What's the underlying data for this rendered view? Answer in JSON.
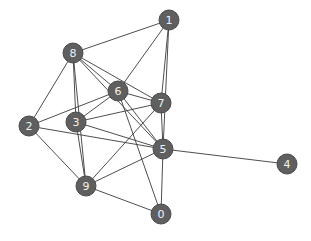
{
  "graph": {
    "node_color": "#5f5f5f",
    "label_color": "#f2f2f2",
    "edge_color": "#3a3a3a",
    "nodes": [
      {
        "id": "0",
        "label": "0",
        "x": 161,
        "y": 214
      },
      {
        "id": "1",
        "label": "1",
        "x": 169,
        "y": 20
      },
      {
        "id": "2",
        "label": "2",
        "x": 29,
        "y": 126
      },
      {
        "id": "3",
        "label": "3",
        "x": 76,
        "y": 122
      },
      {
        "id": "4",
        "label": "4",
        "x": 287,
        "y": 164
      },
      {
        "id": "5",
        "label": "5",
        "x": 163,
        "y": 149
      },
      {
        "id": "6",
        "label": "6",
        "x": 118,
        "y": 91
      },
      {
        "id": "7",
        "label": "7",
        "x": 161,
        "y": 103
      },
      {
        "id": "8",
        "label": "8",
        "x": 73,
        "y": 53
      },
      {
        "id": "9",
        "label": "9",
        "x": 86,
        "y": 186
      }
    ],
    "edges": [
      [
        "8",
        "1"
      ],
      [
        "8",
        "2"
      ],
      [
        "8",
        "3"
      ],
      [
        "8",
        "9"
      ],
      [
        "8",
        "6"
      ],
      [
        "8",
        "7"
      ],
      [
        "8",
        "5"
      ],
      [
        "1",
        "6"
      ],
      [
        "1",
        "7"
      ],
      [
        "1",
        "5"
      ],
      [
        "2",
        "6"
      ],
      [
        "2",
        "5"
      ],
      [
        "2",
        "9"
      ],
      [
        "3",
        "6"
      ],
      [
        "3",
        "7"
      ],
      [
        "3",
        "5"
      ],
      [
        "3",
        "9"
      ],
      [
        "6",
        "7"
      ],
      [
        "6",
        "5"
      ],
      [
        "6",
        "0"
      ],
      [
        "7",
        "5"
      ],
      [
        "7",
        "9"
      ],
      [
        "9",
        "5"
      ],
      [
        "9",
        "0"
      ],
      [
        "5",
        "0"
      ],
      [
        "5",
        "4"
      ]
    ]
  }
}
